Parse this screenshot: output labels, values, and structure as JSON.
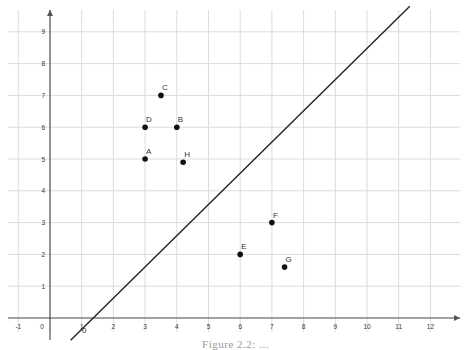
{
  "chart_data": {
    "type": "scatter",
    "title": "",
    "xlabel": "",
    "ylabel": "",
    "xlim": [
      -1.3,
      12.8
    ],
    "ylim": [
      -0.4,
      9.7
    ],
    "grid": true,
    "x_ticks": [
      -1,
      0,
      1,
      2,
      3,
      4,
      5,
      6,
      7,
      8,
      9,
      10,
      11,
      12
    ],
    "y_ticks": [
      1,
      2,
      3,
      4,
      5,
      6,
      7,
      8,
      9
    ],
    "origin_label": "0",
    "points": [
      {
        "label": "A",
        "x": 3,
        "y": 5
      },
      {
        "label": "B",
        "x": 4,
        "y": 6
      },
      {
        "label": "C",
        "x": 3.5,
        "y": 7
      },
      {
        "label": "D",
        "x": 3,
        "y": 6
      },
      {
        "label": "E",
        "x": 6,
        "y": 2
      },
      {
        "label": "F",
        "x": 7,
        "y": 3
      },
      {
        "label": "G",
        "x": 7.4,
        "y": 1.6
      },
      {
        "label": "H",
        "x": 4.2,
        "y": 4.9
      }
    ],
    "lines": [
      {
        "name": "separating-line",
        "x1": 0.65,
        "y1": -0.7,
        "x2": 11.35,
        "y2": 9.8
      }
    ],
    "colors": {
      "grid": "#dcdcdc",
      "axis": "#555555",
      "point": "#111111",
      "line": "#222222",
      "text": "#333333"
    }
  },
  "caption": "Figure 2.2: ..."
}
